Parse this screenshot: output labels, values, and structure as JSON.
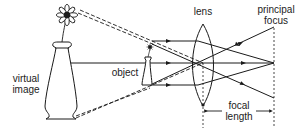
{
  "labels": {
    "lens": "lens",
    "principal_focus_1": "principal",
    "principal_focus_2": "focus",
    "virtual_image_1": "virtual",
    "virtual_image_2": "image",
    "object": "object",
    "focal_length_1": "focal",
    "focal_length_2": "length"
  },
  "colors": {
    "ink": "#1a1a1a",
    "background": "#ffffff"
  }
}
